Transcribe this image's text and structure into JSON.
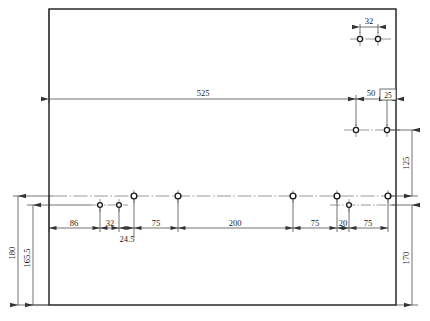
{
  "drawing": {
    "type": "engineering-dimensioned-panel-drawing",
    "background_color": "#ffffff",
    "line_color": "#333333",
    "outline_color": "#1a1a1a",
    "part": {
      "name": "rectangular-panel",
      "outline": {
        "x": 49,
        "y": 9,
        "width": 347,
        "height": 296
      }
    },
    "dimensions": {
      "top_pair_spacing": "32",
      "overall_length": "525",
      "right_offset_50": "50",
      "right_offset_25_boxed": "25",
      "vertical_125": "125",
      "vertical_170": "170",
      "vertical_180": "180",
      "vertical_165_5": "165.5",
      "chain_86": "86",
      "chain_32": "32",
      "chain_24_5": "24.5",
      "chain_75_a": "75",
      "chain_200": "200",
      "chain_75_b": "75",
      "chain_20": "20",
      "chain_75_c": "75"
    },
    "holes": {
      "top_cluster": [
        {
          "cx": 360,
          "cy": 39
        },
        {
          "cx": 378,
          "cy": 39
        }
      ],
      "upper_right_row": [
        {
          "cx": 356,
          "cy": 130
        },
        {
          "cx": 387,
          "cy": 130
        }
      ],
      "main_centerline_row": [
        {
          "cx": 134,
          "cy": 196
        },
        {
          "cx": 178,
          "cy": 196
        },
        {
          "cx": 293,
          "cy": 196
        },
        {
          "cx": 337,
          "cy": 196
        },
        {
          "cx": 388,
          "cy": 196
        }
      ],
      "lower_offset_row": [
        {
          "cx": 100,
          "cy": 205
        },
        {
          "cx": 119,
          "cy": 205
        },
        {
          "cx": 349,
          "cy": 205
        }
      ]
    }
  }
}
